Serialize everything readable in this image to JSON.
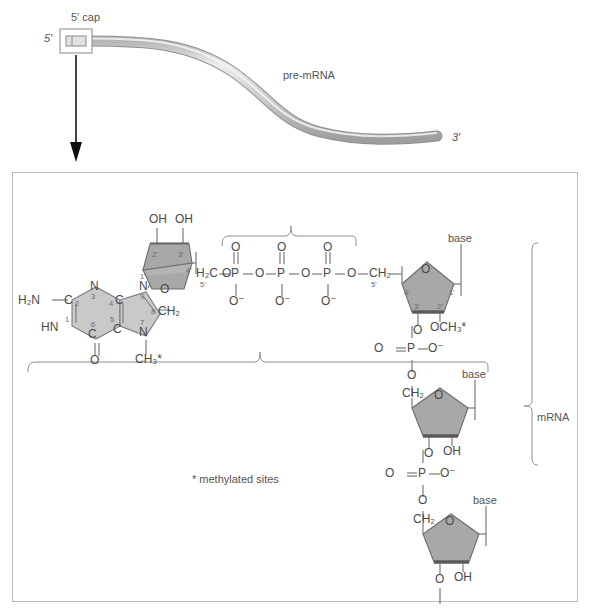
{
  "figure": {
    "title_top": "pre-mRNA",
    "cap_label": "5' cap",
    "five_prime": "5'",
    "three_prime": "3'",
    "footnote": "* methylated sites",
    "mrna_label": "mRNA",
    "base_label": "base"
  },
  "colors": {
    "sugar_fill": "#a8a8a8",
    "sugar_edge": "#6b6b6b",
    "ring_fill": "#c9c9c9",
    "strand_light": "#d8d8d8",
    "strand_dark": "#9a9a9a",
    "panel_border": "#b9b9b9",
    "text": "#4a4a4a",
    "arrow": "#111111"
  },
  "guanine": {
    "amino": "H₂N",
    "n1_label": "HN",
    "n3_label": "N",
    "n7_label": "N",
    "n9_label": "N",
    "c2_label": "C",
    "c4_label": "C",
    "c5_label": "C",
    "c6_label": "C",
    "o6_label": "O",
    "c8_methylene": "CH₂",
    "n7_methyl": "CH₃*",
    "positions": [
      "1",
      "2",
      "3",
      "4",
      "5",
      "6",
      "7",
      "8",
      "9"
    ]
  },
  "cap_ribose": {
    "oh_2prime": "OH",
    "oh_3prime": "OH",
    "ring_oxygen": "O",
    "c1": "1'",
    "c2": "2'",
    "c3": "3'",
    "c4": "4'",
    "c5_label": "H₂C",
    "c5_prime": "5'"
  },
  "triphosphate": {
    "p_label": "P",
    "double_o": "O",
    "anionic_o": "O⁻",
    "bridge_o": "O",
    "count": 3
  },
  "nucleotides": [
    {
      "id": "n1",
      "base": "base",
      "ring_oxygen": "O",
      "c1": "1'",
      "c2": "2'",
      "c3": "3'",
      "c4": "4'",
      "c5_label": "CH₂",
      "c5_prime": "5'",
      "two_prime_group": "OCH₃*",
      "three_prime_group": "O"
    },
    {
      "id": "n2",
      "base": "base",
      "ring_oxygen": "O",
      "c5_label": "CH₂",
      "two_prime_group": "OH",
      "three_prime_group": "O"
    },
    {
      "id": "n3",
      "base": "base",
      "ring_oxygen": "O",
      "c5_label": "CH₂",
      "two_prime_group": "OH",
      "three_prime_group": "O"
    }
  ],
  "phosphodiesters": [
    {
      "p": "P",
      "double_o": "O",
      "anionic_o": "O⁻",
      "bridge_o": "O"
    },
    {
      "p": "P",
      "double_o": "O",
      "anionic_o": "O⁻",
      "bridge_o": "O"
    },
    {
      "p": "P",
      "double_o": "O",
      "anionic_o": "O⁻",
      "bridge_o": "O"
    }
  ]
}
